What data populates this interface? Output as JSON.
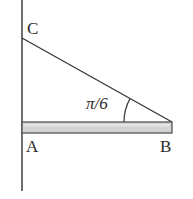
{
  "figure": {
    "type": "geometry-diagram",
    "background_color": "#ffffff",
    "stroke_color": "#4a4a4a",
    "line_color": "#3a3a3a",
    "beam_fill_color": "#d4d4d4",
    "beam_edge_color": "#555555",
    "text_color": "#2b2b2b",
    "labels": {
      "vertex_c": "C",
      "vertex_a": "A",
      "vertex_b": "B",
      "angle": "π/6"
    },
    "geometry": {
      "wall_line": {
        "x": 22,
        "y_top": 0,
        "y_bottom": 191
      },
      "beam": {
        "x_left": 22,
        "x_right": 172,
        "y_top": 122,
        "y_bottom": 133
      },
      "hypotenuse": {
        "x1": 22,
        "y1": 38,
        "x2": 172,
        "y2": 122
      },
      "angle_arc": {
        "center_x": 172,
        "center_y": 122,
        "radius": 48,
        "start_deg": 180,
        "end_deg": 209
      },
      "angle_value": "π/6"
    }
  }
}
